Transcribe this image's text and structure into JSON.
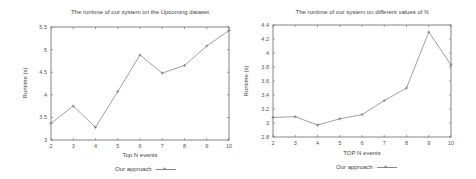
{
  "chart_data": [
    {
      "type": "line",
      "title": "The runtime of our system on the Upcoming dataset",
      "xlabel": "Top N events",
      "ylabel": "Runtime (s)",
      "x": [
        2,
        3,
        4,
        5,
        6,
        7,
        8,
        9,
        10
      ],
      "series": [
        {
          "name": "Our approach",
          "values": [
            3.37,
            3.75,
            3.28,
            4.07,
            4.88,
            4.48,
            4.65,
            5.08,
            5.42
          ]
        }
      ],
      "xlim": [
        2,
        10
      ],
      "ylim": [
        3,
        5.5
      ],
      "xticks": [
        "2",
        "3",
        "4",
        "5",
        "6",
        "7",
        "8",
        "9",
        "10"
      ],
      "yticks": [
        "3",
        "3.5",
        "4",
        "4.5",
        "5",
        "5.5"
      ],
      "grid": false,
      "legend_position": "bottom"
    },
    {
      "type": "line",
      "title": "The runtime of our system on different values of N",
      "xlabel": "TOP N events",
      "ylabel": "Runtime (s)",
      "x": [
        2,
        3,
        4,
        5,
        6,
        7,
        8,
        9,
        10
      ],
      "series": [
        {
          "name": "Our approach",
          "values": [
            3.08,
            3.09,
            2.97,
            3.06,
            3.12,
            3.32,
            3.5,
            4.3,
            3.83
          ]
        }
      ],
      "xlim": [
        2,
        10
      ],
      "ylim": [
        2.8,
        4.4
      ],
      "xticks": [
        "2",
        "3",
        "4",
        "5",
        "6",
        "7",
        "8",
        "9",
        "10"
      ],
      "yticks": [
        "2.8",
        "3",
        "3.2",
        "3.4",
        "3.6",
        "3.8",
        "4",
        "4.2",
        "4.4"
      ],
      "grid": false,
      "legend_position": "bottom"
    }
  ]
}
